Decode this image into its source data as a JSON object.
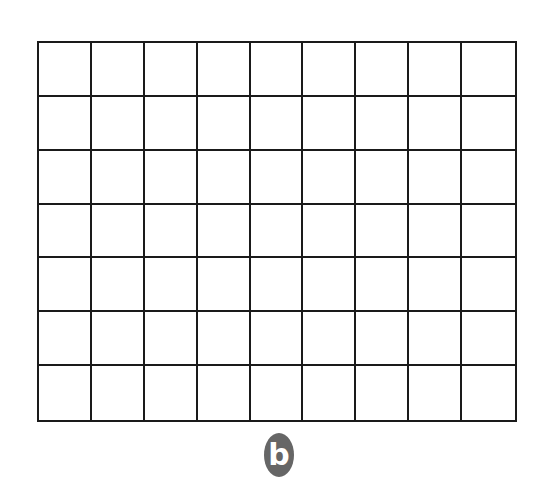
{
  "grid": {
    "columns": 9,
    "rows": 7,
    "line_color": "#1a1a1a",
    "cell_color": "#ffffff"
  },
  "badge": {
    "label": "b",
    "color": "#666666",
    "text_color": "#ffffff"
  }
}
